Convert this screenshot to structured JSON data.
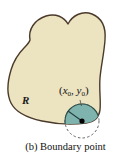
{
  "figure": {
    "caption": "(b) Boundary point",
    "region_label": "R",
    "point_label_open": "(",
    "point_label_x": "x",
    "point_label_x_sub": "0",
    "point_label_sep": ", ",
    "point_label_y": "y",
    "point_label_y_sub": "0",
    "point_label_close": ")",
    "colors": {
      "background": "#ffffff",
      "region_fill": "#ece3c0",
      "region_stroke": "#4b3a2a",
      "disk_fill": "#7fb3ae",
      "disk_stroke": "#2f4f4c",
      "dashed_stroke": "#555555",
      "point_dot": "#000000",
      "text": "#111111"
    },
    "geometry": {
      "disk_center_x": 82,
      "disk_center_y": 121,
      "disk_radius": 17,
      "radius_line_angle_deg": 145
    }
  }
}
